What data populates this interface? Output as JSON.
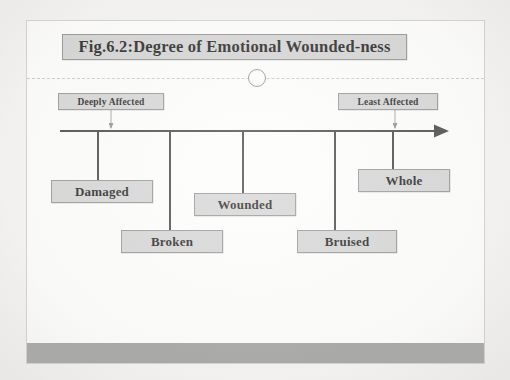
{
  "figure": {
    "title": "Fig.6.2:Degree of Emotional Wounded-ness",
    "type": "spectrum-diagram"
  },
  "endpoints": [
    {
      "label": "Deeply Affected",
      "side": "left"
    },
    {
      "label": "Least Affected",
      "side": "right"
    }
  ],
  "terms": [
    {
      "label": "Damaged",
      "position": 1
    },
    {
      "label": "Broken",
      "position": 2
    },
    {
      "label": "Wounded",
      "position": 3
    },
    {
      "label": "Bruised",
      "position": 4
    },
    {
      "label": "Whole",
      "position": 5
    }
  ],
  "colors": {
    "box_fill": "#d2d2d2",
    "box_border": "#8e8e8e",
    "slide_background": "#fdfdfc",
    "footer_band": "#9b9b9b",
    "line": "#3a3a3a",
    "page_background": "#f4f3f1"
  },
  "decorations": {
    "circle_marker": "circle-outline",
    "axis_arrow": "arrow-right",
    "dotted_rule": "dashed-horizontal-rule"
  }
}
